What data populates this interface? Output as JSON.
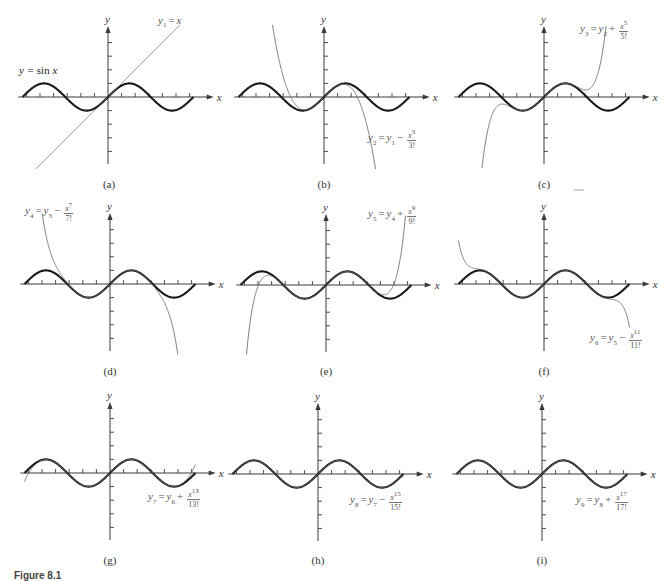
{
  "figure": {
    "caption": "Figure 8.1",
    "axis_labels": {
      "x": "x",
      "y": "y"
    },
    "sin_label": {
      "lhs": "y",
      "eq": " = ",
      "fn": "sin",
      "arg": " x"
    },
    "colors": {
      "sine": "#1a1a1a",
      "approx": "#6e6e6e",
      "axis": "#3a3a3a"
    }
  },
  "panels": [
    {
      "id": "a",
      "label": "(a)",
      "eq": {
        "lhs": "y",
        "lhs_sub": "1",
        "rhs": "x",
        "rhs_sub": "",
        "op": "",
        "num": "",
        "num_sup": "",
        "den": ""
      }
    },
    {
      "id": "b",
      "label": "(b)",
      "eq": {
        "lhs": "y",
        "lhs_sub": "2",
        "rhs": "y",
        "rhs_sub": "1",
        "op": "−",
        "num": "x",
        "num_sup": "3",
        "den": "3!"
      }
    },
    {
      "id": "c",
      "label": "(c)",
      "eq": {
        "lhs": "y",
        "lhs_sub": "3",
        "rhs": "y",
        "rhs_sub": "2",
        "op": "+",
        "num": "x",
        "num_sup": "5",
        "den": "5!"
      }
    },
    {
      "id": "d",
      "label": "(d)",
      "eq": {
        "lhs": "y",
        "lhs_sub": "4",
        "rhs": "y",
        "rhs_sub": "3",
        "op": "−",
        "num": "x",
        "num_sup": "7",
        "den": "7!"
      }
    },
    {
      "id": "e",
      "label": "(e)",
      "eq": {
        "lhs": "y",
        "lhs_sub": "5",
        "rhs": "y",
        "rhs_sub": "4",
        "op": "+",
        "num": "x",
        "num_sup": "9",
        "den": "9!"
      }
    },
    {
      "id": "f",
      "label": "(f)",
      "eq": {
        "lhs": "y",
        "lhs_sub": "6",
        "rhs": "y",
        "rhs_sub": "5",
        "op": "−",
        "num": "x",
        "num_sup": "11",
        "den": "11!"
      }
    },
    {
      "id": "g",
      "label": "(g)",
      "eq": {
        "lhs": "y",
        "lhs_sub": "7",
        "rhs": "y",
        "rhs_sub": "6",
        "op": "+",
        "num": "x",
        "num_sup": "13",
        "den": "13!"
      }
    },
    {
      "id": "h",
      "label": "(h)",
      "eq": {
        "lhs": "y",
        "lhs_sub": "8",
        "rhs": "y",
        "rhs_sub": "7",
        "op": "−",
        "num": "x",
        "num_sup": "15",
        "den": "15!"
      }
    },
    {
      "id": "i",
      "label": "(i)",
      "eq": {
        "lhs": "y",
        "lhs_sub": "9",
        "rhs": "y",
        "rhs_sub": "8",
        "op": "+",
        "num": "x",
        "num_sup": "17",
        "den": "17!"
      }
    }
  ],
  "chart_data": {
    "type": "line",
    "xlabel": "x",
    "ylabel": "y",
    "xlim": [
      -6.3,
      6.3
    ],
    "ylim": [
      -5,
      5
    ],
    "grid": false,
    "x_ticks": [
      -6,
      -5,
      -4,
      -3,
      -2,
      -1,
      1,
      2,
      3,
      4,
      5,
      6
    ],
    "y_ticks": [
      -4,
      -3,
      -2,
      -1,
      1,
      2,
      3,
      4
    ],
    "reference_series": {
      "name": "y = sin x",
      "function": "sin(x)",
      "x_range": [
        -6.2832,
        6.2832
      ]
    },
    "panels": [
      {
        "label": "(a)",
        "series": "y1 = x",
        "degree": 1
      },
      {
        "label": "(b)",
        "series": "y2 = y1 - x^3/3!",
        "degree": 3
      },
      {
        "label": "(c)",
        "series": "y3 = y2 + x^5/5!",
        "degree": 5
      },
      {
        "label": "(d)",
        "series": "y4 = y3 - x^7/7!",
        "degree": 7
      },
      {
        "label": "(e)",
        "series": "y5 = y4 + x^9/9!",
        "degree": 9
      },
      {
        "label": "(f)",
        "series": "y6 = y5 - x^11/11!",
        "degree": 11
      },
      {
        "label": "(g)",
        "series": "y7 = y6 + x^13/13!",
        "degree": 13
      },
      {
        "label": "(h)",
        "series": "y8 = y7 - x^15/15!",
        "degree": 15
      },
      {
        "label": "(i)",
        "series": "y9 = y8 + x^17/17!",
        "degree": 17
      }
    ]
  }
}
